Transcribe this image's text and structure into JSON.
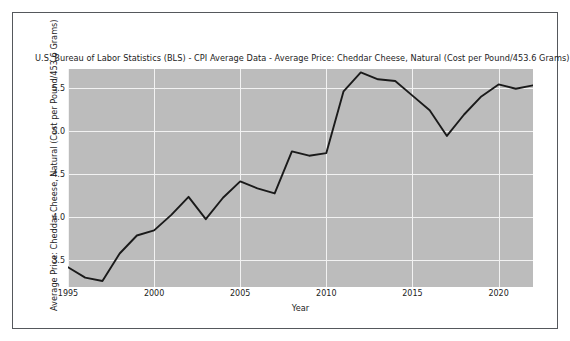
{
  "figure": {
    "title": "U.S. Bureau of Labor Statistics (BLS)  - CPI Average Data - Average Price: Cheddar Cheese, Natural (Cost per Pound/453.6 Grams)",
    "background_color": "#ffffff",
    "plot_background_color": "#bcbcbc",
    "grid_color": "#f2f2f2",
    "line_color": "#1a1a1a",
    "frame_color": "#55585c"
  },
  "chart_data": {
    "type": "line",
    "title": "U.S. Bureau of Labor Statistics (BLS)  - CPI Average Data - Average Price: Cheddar Cheese, Natural (Cost per Pound/453.6 Grams)",
    "xlabel": "Year",
    "ylabel": "Average Price: Cheddar Cheese, Natural (Cost per Pound/453.6 Grams)",
    "xlim": [
      1995,
      2022
    ],
    "ylim": [
      3.18,
      5.72
    ],
    "grid": true,
    "legend": "none",
    "xticks": [
      1995,
      2000,
      2005,
      2010,
      2015,
      2020
    ],
    "xtick_labels": [
      "1995",
      "2000",
      "2005",
      "2010",
      "2015",
      "2020"
    ],
    "yticks": [
      3.5,
      4.0,
      4.5,
      5.0,
      5.5
    ],
    "ytick_labels": [
      "3.5",
      "4.0",
      "4.5",
      "5.0",
      "5.5"
    ],
    "series": [
      {
        "name": "Average Price: Cheddar Cheese, Natural",
        "x": [
          1995,
          1996,
          1997,
          1998,
          1999,
          2000,
          2001,
          2002,
          2003,
          2004,
          2005,
          2006,
          2007,
          2008,
          2009,
          2010,
          2011,
          2012,
          2013,
          2014,
          2015,
          2016,
          2017,
          2018,
          2019,
          2020,
          2021,
          2022
        ],
        "values": [
          3.41,
          3.29,
          3.25,
          3.57,
          3.78,
          3.84,
          4.02,
          4.23,
          3.97,
          4.22,
          4.41,
          4.33,
          4.27,
          4.76,
          4.71,
          4.74,
          5.46,
          5.68,
          5.6,
          5.58,
          5.41,
          5.24,
          4.94,
          5.19,
          5.4,
          5.54,
          5.49,
          5.53
        ]
      }
    ]
  },
  "axes": {
    "x_title": "Year",
    "y_title": "Average Price: Cheddar Cheese, Natural (Cost per Pound/453.6 Grams)"
  }
}
